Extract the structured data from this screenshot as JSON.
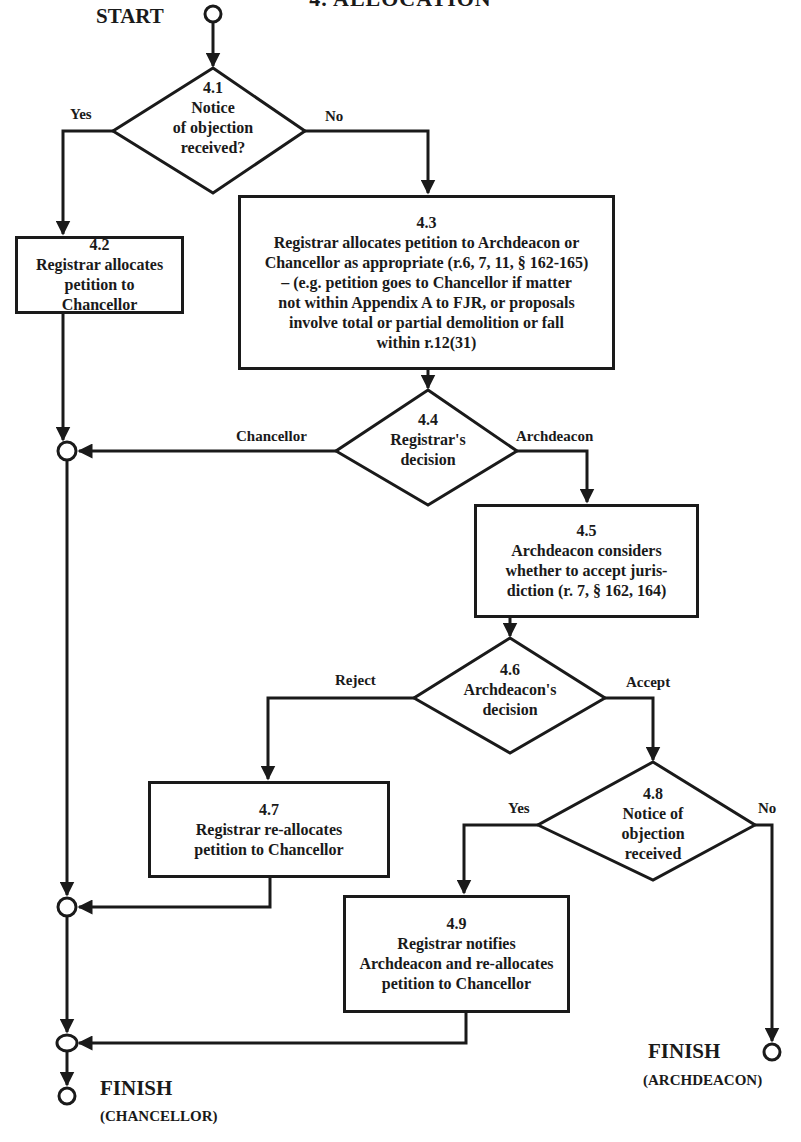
{
  "title": "4. ALLOCATION",
  "start_label": "START",
  "nodes": {
    "n41": {
      "id": "4.1",
      "type": "decision",
      "lines": [
        "Notice",
        "of objection",
        "received?"
      ],
      "yes_label": "Yes",
      "no_label": "No"
    },
    "n42": {
      "id": "4.2",
      "type": "process",
      "lines": [
        "Registrar allocates",
        "petition to",
        "Chancellor"
      ]
    },
    "n43": {
      "id": "4.3",
      "type": "process",
      "lines": [
        "Registrar allocates petition to Archdeacon or",
        "Chancellor as appropriate (r.6, 7, 11, § 162-165)",
        "– (e.g. petition goes to Chancellor if matter",
        "not within Appendix A to FJR, or proposals",
        "involve total or partial demolition or fall",
        "within r.12(31)"
      ]
    },
    "n44": {
      "id": "4.4",
      "type": "decision",
      "lines": [
        "Registrar's",
        "decision"
      ],
      "left_label": "Chancellor",
      "right_label": "Archdeacon"
    },
    "n45": {
      "id": "4.5",
      "type": "process",
      "lines": [
        "Archdeacon considers",
        "whether to accept juris-",
        "diction (r. 7, § 162, 164)"
      ]
    },
    "n46": {
      "id": "4.6",
      "type": "decision",
      "lines": [
        "Archdeacon's",
        "decision"
      ],
      "left_label": "Reject",
      "right_label": "Accept"
    },
    "n47": {
      "id": "4.7",
      "type": "process",
      "lines": [
        "Registrar re-allocates",
        "petition to Chancellor"
      ]
    },
    "n48": {
      "id": "4.8",
      "type": "decision",
      "lines": [
        "Notice of",
        "objection",
        "received"
      ],
      "yes_label": "Yes",
      "no_label": "No"
    },
    "n49": {
      "id": "4.9",
      "type": "process",
      "lines": [
        "Registrar notifies",
        "Archdeacon and re-allocates",
        "petition to Chancellor"
      ]
    }
  },
  "finish_chancellor": {
    "label": "FINISH",
    "sub": "(CHANCELLOR)"
  },
  "finish_archdeacon": {
    "label": "FINISH",
    "sub": "(ARCHDEACON)"
  },
  "colors": {
    "ink": "#1a1a1a",
    "paper": "#ffffff"
  }
}
